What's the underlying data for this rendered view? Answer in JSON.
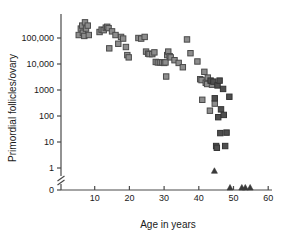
{
  "chart_data": {
    "type": "scatter",
    "title": "",
    "xlabel": "Age in years",
    "ylabel": "Primordial follicles/ovary",
    "xlim": [
      3,
      62
    ],
    "xticks": [
      10,
      20,
      30,
      40,
      50,
      60
    ],
    "xtick_labels": [
      "10",
      "20",
      "30",
      "40",
      "50",
      "60"
    ],
    "yscale": "log",
    "yticks": [
      100000,
      10000,
      1000,
      100,
      10,
      1,
      0
    ],
    "ytick_labels": [
      "100,000",
      "10,000",
      "1000",
      "100",
      "10",
      "1",
      "0"
    ],
    "axis_break": true,
    "grid": false,
    "legend": "none",
    "series": [
      {
        "name": "light-square",
        "marker": "square",
        "fill": "#8d8d8d",
        "edge": "#4a4a4a",
        "points": [
          [
            5.4,
            130000
          ],
          [
            6.0,
            230000
          ],
          [
            6.4,
            300000
          ],
          [
            6.6,
            160000
          ],
          [
            7.0,
            120000
          ],
          [
            7.2,
            400000
          ],
          [
            7.5,
            230000
          ],
          [
            8.0,
            300000
          ],
          [
            8.3,
            130000
          ],
          [
            11.4,
            170000
          ],
          [
            12.0,
            210000
          ],
          [
            12.6,
            200000
          ],
          [
            13.2,
            250000
          ],
          [
            13.6,
            270000
          ],
          [
            14.0,
            240000
          ],
          [
            14.2,
            40000
          ],
          [
            15.0,
            180000
          ],
          [
            16.0,
            130000
          ],
          [
            16.8,
            60000
          ],
          [
            17.6,
            110000
          ],
          [
            18.2,
            95000
          ],
          [
            19.0,
            45000
          ],
          [
            19.4,
            22000
          ],
          [
            19.8,
            18000
          ],
          [
            22.6,
            100000
          ],
          [
            23.4,
            95000
          ],
          [
            24.4,
            110000
          ],
          [
            24.8,
            30000
          ],
          [
            25.4,
            25000
          ],
          [
            25.8,
            24000
          ],
          [
            26.6,
            24000
          ],
          [
            27.2,
            28000
          ],
          [
            27.6,
            12000
          ],
          [
            28.2,
            11500
          ],
          [
            28.8,
            11500
          ],
          [
            29.4,
            11500
          ],
          [
            30.0,
            11000
          ],
          [
            30.4,
            11500
          ],
          [
            30.6,
            3300
          ],
          [
            30.9,
            22000
          ],
          [
            31.2,
            30000
          ],
          [
            31.6,
            20000
          ],
          [
            31.9,
            18000
          ],
          [
            33.0,
            14000
          ],
          [
            34.2,
            11000
          ],
          [
            35.4,
            7500
          ],
          [
            36.6,
            88000
          ],
          [
            37.6,
            26000
          ],
          [
            39.6,
            12500
          ],
          [
            40.4,
            2600
          ],
          [
            40.8,
            2400
          ],
          [
            41.0,
            420
          ],
          [
            41.6,
            5000
          ],
          [
            42.0,
            1900
          ],
          [
            42.4,
            1700
          ],
          [
            42.6,
            3000
          ],
          [
            43.2,
            160
          ],
          [
            43.8,
            1600
          ],
          [
            44.6,
            300
          ]
        ]
      },
      {
        "name": "dark-square",
        "marker": "square",
        "fill": "#4e4e4e",
        "edge": "#333333",
        "points": [
          [
            43.4,
            2300
          ],
          [
            44.2,
            2100
          ],
          [
            44.6,
            480
          ],
          [
            45.0,
            7
          ],
          [
            45.2,
            6
          ],
          [
            45.4,
            1500
          ],
          [
            45.6,
            90
          ],
          [
            46.0,
            2300
          ],
          [
            46.2,
            22
          ],
          [
            46.4,
            180
          ],
          [
            47.0,
            1100
          ],
          [
            47.2,
            110
          ],
          [
            47.6,
            7
          ],
          [
            48.0,
            23
          ],
          [
            48.8,
            550
          ]
        ]
      },
      {
        "name": "dark-triangle",
        "marker": "triangle",
        "fill": "#3a3a3a",
        "edge": "#3a3a3a",
        "points": [
          [
            44.5,
            0.8
          ],
          [
            49.0,
            0
          ],
          [
            52.4,
            0
          ],
          [
            53.4,
            0
          ],
          [
            54.8,
            0
          ]
        ]
      }
    ]
  },
  "colors": {
    "axis": "#4a4a4a",
    "text": "#1a1a1a",
    "background": "#ffffff"
  }
}
